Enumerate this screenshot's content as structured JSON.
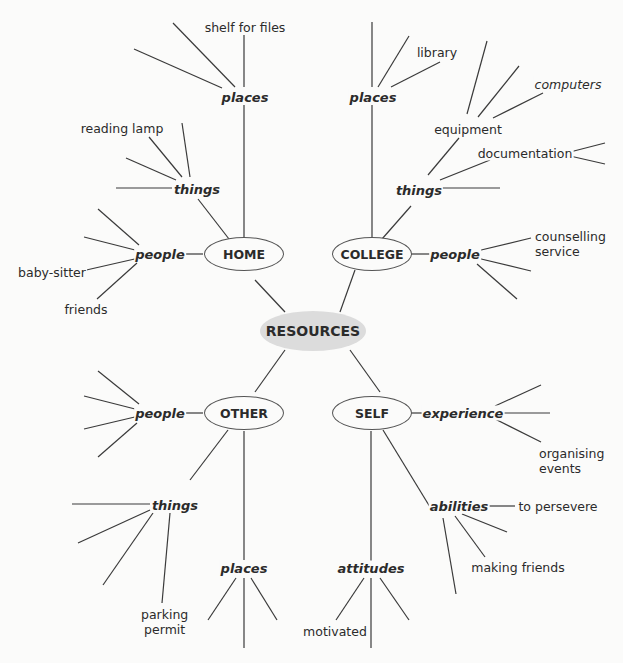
{
  "root": {
    "label": "RESOURCES",
    "fill": "#dcdcdc"
  },
  "branches": {
    "home": {
      "label": "HOME",
      "places": {
        "label": "places",
        "leaves": [
          "shelf for files"
        ]
      },
      "things": {
        "label": "things",
        "leaves": [
          "reading lamp"
        ]
      },
      "people": {
        "label": "people",
        "leaves": [
          "baby-sitter",
          "friends"
        ]
      }
    },
    "college": {
      "label": "COLLEGE",
      "places": {
        "label": "places",
        "leaves": [
          "library"
        ]
      },
      "things": {
        "label": "things",
        "leaves": [
          "equipment",
          "computers",
          "documentation"
        ]
      },
      "people": {
        "label": "people",
        "leaves": [
          "counselling service"
        ]
      }
    },
    "other": {
      "label": "OTHER",
      "people": {
        "label": "people",
        "leaves": []
      },
      "things": {
        "label": "things",
        "leaves": [
          "parking permit"
        ]
      },
      "places": {
        "label": "places",
        "leaves": []
      }
    },
    "self": {
      "label": "SELF",
      "experience": {
        "label": "experience",
        "leaves": [
          "organising events"
        ]
      },
      "abilities": {
        "label": "abilities",
        "leaves": [
          "to persevere",
          "making friends"
        ]
      },
      "attitudes": {
        "label": "attitudes",
        "leaves": [
          "motivated"
        ]
      }
    }
  },
  "labels": {
    "shelf_for_files": "shelf for files",
    "reading_lamp": "reading lamp",
    "baby_sitter": "baby-sitter",
    "friends": "friends",
    "library": "library",
    "computers": "computers",
    "equipment": "equipment",
    "documentation": "documentation",
    "counselling_1": "counselling",
    "counselling_2": "service",
    "parking_1": "parking",
    "parking_2": "permit",
    "organising_1": "organising",
    "organising_2": "events",
    "to_persevere": "to persevere",
    "making_friends": "making friends",
    "motivated": "motivated"
  }
}
